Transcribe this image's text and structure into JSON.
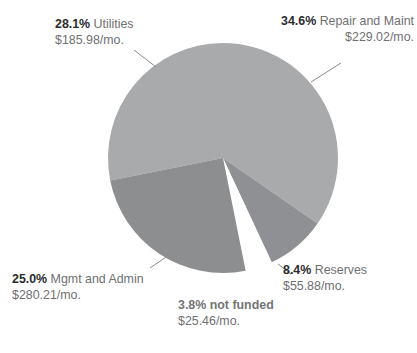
{
  "chart_data": {
    "type": "pie",
    "title": "",
    "subtitle": "",
    "xlabel": "",
    "ylabel": "",
    "legend_position": "callout-labels",
    "grid": false,
    "units": "$/mo.",
    "categories": [
      "Repair and Maint",
      "Reserves",
      "not funded",
      "Mgmt and Admin",
      "Utilities"
    ],
    "values": [
      34.6,
      8.4,
      3.8,
      25.0,
      28.1
    ],
    "amounts": [
      229.02,
      55.88,
      25.46,
      280.21,
      185.98
    ],
    "slices": [
      {
        "name": "Repair and Maint",
        "percent_label": "34.6%",
        "percent": 34.6,
        "amount_label": "$229.02/mo.",
        "amount": 229.02,
        "color": "#a9aaac",
        "start_angle": 0,
        "end_angle": 124.56,
        "bold_name": false,
        "exploded": false
      },
      {
        "name": "Reserves",
        "percent_label": "8.4%",
        "percent": 8.4,
        "amount_label": "$55.88/mo.",
        "amount": 55.88,
        "color": "#8f9093",
        "start_angle": 124.56,
        "end_angle": 154.8,
        "bold_name": false,
        "exploded": false
      },
      {
        "name": "not funded",
        "percent_label": "3.8%",
        "percent": 3.8,
        "amount_label": "$25.46/mo.",
        "amount": 25.46,
        "color": "#ffffff",
        "start_angle": 154.8,
        "end_angle": 168.48,
        "bold_name": true,
        "exploded": true
      },
      {
        "name": "Mgmt and Admin",
        "percent_label": "25.0%",
        "percent": 25.0,
        "amount_label": "$280.21/mo.",
        "amount": 280.21,
        "color": "#8d8e90",
        "start_angle": 168.48,
        "end_angle": 258.48,
        "bold_name": false,
        "exploded": false
      },
      {
        "name": "Utilities",
        "percent_label": "28.1%",
        "percent": 28.1,
        "amount_label": "$185.98/mo.",
        "amount": 185.98,
        "color": "#a9aaac",
        "start_angle": 258.48,
        "end_angle": 360,
        "bold_name": false,
        "exploded": false
      }
    ]
  },
  "colors": {
    "slice_light": "#a9aaac",
    "slice_medium": "#8f9093",
    "slice_dark": "#8d8e90",
    "gap": "#ffffff",
    "leader_line": "#8a8b8d",
    "text_bold": "#2b2b2d",
    "text_regular": "#6f7072"
  }
}
